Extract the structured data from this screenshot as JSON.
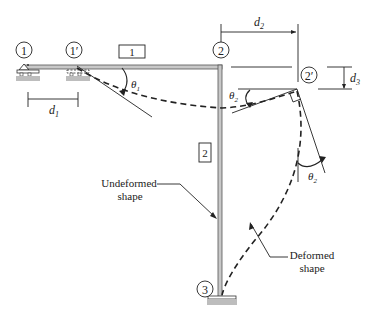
{
  "diagram": {
    "type": "frame-deformation",
    "nodes": [
      {
        "id": "1",
        "label": "1",
        "x": 21,
        "y": 50
      },
      {
        "id": "1p",
        "label": "1′",
        "x": 71,
        "y": 50
      },
      {
        "id": "2",
        "label": "2",
        "x": 221,
        "y": 50
      },
      {
        "id": "2p",
        "label": "2′",
        "x": 309,
        "y": 75
      },
      {
        "id": "3",
        "label": "3",
        "x": 205,
        "y": 290
      }
    ],
    "elements": [
      {
        "id": "1",
        "label": "1"
      },
      {
        "id": "2",
        "label": "2"
      }
    ],
    "dimensions": {
      "d1": "d",
      "d1_sub": "1",
      "d2": "d",
      "d2_sub": "2",
      "d3": "d",
      "d3_sub": "3"
    },
    "angles": {
      "theta1": "θ",
      "theta1_sub": "1",
      "theta2_top": "θ",
      "theta2_top_sub": "2",
      "theta2_right": "θ",
      "theta2_right_sub": "2"
    },
    "annotations": {
      "undeformed_line1": "Undeformed",
      "undeformed_line2": "shape",
      "deformed_line1": "Deformed",
      "deformed_line2": "shape"
    },
    "colors": {
      "member_fill": "#c8c8c8",
      "member_stroke": "#555555",
      "ground": "#bdbdbd",
      "ink": "#222222"
    }
  }
}
